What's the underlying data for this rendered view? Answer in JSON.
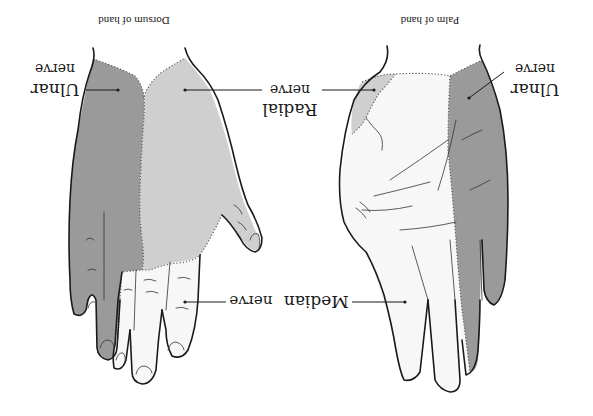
{
  "figure": {
    "orientation": "rotated 180 degrees",
    "colors": {
      "background": "#ffffff",
      "ulnar_fill": "#9a9a9a",
      "radial_fill": "#cfcfcf",
      "median_fill": "#f7f7f7",
      "outline": "#1a1a1a"
    },
    "panels": [
      {
        "id": "dorsum",
        "caption": "Dorsum of hand",
        "labels": {
          "ulnar": [
            "Ulnar",
            "nerve"
          ],
          "radial": [
            "Radial",
            "nerve"
          ],
          "median": [
            "Median",
            "nerve"
          ]
        }
      },
      {
        "id": "palm",
        "caption": "Palm of hand",
        "labels": {
          "ulnar": [
            "Ulnar",
            "nerve"
          ]
        }
      }
    ]
  }
}
